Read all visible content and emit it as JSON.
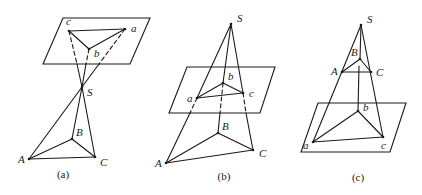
{
  "figure": {
    "panels": [
      {
        "id": "a",
        "caption": "(a)",
        "caption_pos": [
          63,
          178
        ],
        "plane": [
          [
            63,
            18
          ],
          [
            150,
            18
          ],
          [
            130,
            64
          ],
          [
            43,
            64
          ]
        ],
        "points": {
          "c": {
            "xy": [
              69,
              31
            ],
            "label": "c",
            "label_offset": [
              -3,
              -6
            ]
          },
          "a": {
            "xy": [
              125,
              29
            ],
            "label": "a",
            "label_offset": [
              6,
              3
            ]
          },
          "b": {
            "xy": [
              89,
              49
            ],
            "label": "b",
            "label_offset": [
              5,
              8
            ]
          },
          "S": {
            "xy": [
              82,
              87
            ],
            "label": "S",
            "label_offset": [
              5,
              9
            ]
          },
          "B": {
            "xy": [
              72,
              139
            ],
            "label": "B",
            "label_offset": [
              4,
              -3
            ]
          },
          "A": {
            "xy": [
              29,
              159
            ],
            "label": "A",
            "label_offset": [
              -11,
              4
            ]
          },
          "C": {
            "xy": [
              95,
              157
            ],
            "label": "C",
            "label_offset": [
              5,
              9
            ]
          }
        },
        "edges": [
          {
            "from": [
              69,
              31
            ],
            "to": [
              125,
              29
            ],
            "style": "solid"
          },
          {
            "from": [
              69,
              31
            ],
            "to": [
              89,
              49
            ],
            "style": "solid"
          },
          {
            "from": [
              89,
              49
            ],
            "to": [
              125,
              29
            ],
            "style": "solid"
          },
          {
            "from": [
              69,
              31
            ],
            "to": [
              77,
              64
            ],
            "style": "dashed"
          },
          {
            "from": [
              89,
              49
            ],
            "to": [
              86,
              64
            ],
            "style": "dashed"
          },
          {
            "from": [
              125,
              29
            ],
            "to": [
              99,
              64
            ],
            "style": "dashed"
          },
          {
            "from": [
              77,
              64
            ],
            "to": [
              82,
              87
            ],
            "style": "solid"
          },
          {
            "from": [
              86,
              64
            ],
            "to": [
              82,
              87
            ],
            "style": "solid"
          },
          {
            "from": [
              99,
              64
            ],
            "to": [
              82,
              87
            ],
            "style": "solid"
          },
          {
            "from": [
              82,
              87
            ],
            "to": [
              29,
              159
            ],
            "style": "solid"
          },
          {
            "from": [
              82,
              87
            ],
            "to": [
              72,
              139
            ],
            "style": "solid"
          },
          {
            "from": [
              82,
              87
            ],
            "to": [
              95,
              157
            ],
            "style": "solid"
          },
          {
            "from": [
              29,
              159
            ],
            "to": [
              72,
              139
            ],
            "style": "solid"
          },
          {
            "from": [
              72,
              139
            ],
            "to": [
              95,
              157
            ],
            "style": "solid"
          },
          {
            "from": [
              29,
              159
            ],
            "to": [
              95,
              157
            ],
            "style": "solid"
          }
        ]
      },
      {
        "id": "b",
        "caption": "(b)",
        "caption_pos": [
          224,
          180
        ],
        "plane": [
          [
            187,
            67
          ],
          [
            275,
            67
          ],
          [
            260,
            113
          ],
          [
            169,
            113
          ]
        ],
        "points": {
          "S": {
            "xy": [
              231,
              24
            ],
            "label": "S",
            "label_offset": [
              6,
              -2
            ]
          },
          "b": {
            "xy": [
              223,
              83
            ],
            "label": "b",
            "label_offset": [
              5,
              -3
            ]
          },
          "a": {
            "xy": [
              197,
              98
            ],
            "label": "a",
            "label_offset": [
              -10,
              4
            ]
          },
          "c": {
            "xy": [
              243,
              93
            ],
            "label": "c",
            "label_offset": [
              6,
              4
            ]
          },
          "B": {
            "xy": [
              218,
              133
            ],
            "label": "B",
            "label_offset": [
              4,
              -3
            ]
          },
          "A": {
            "xy": [
              166,
              163
            ],
            "label": "A",
            "label_offset": [
              -11,
              4
            ]
          },
          "C": {
            "xy": [
              253,
              150
            ],
            "label": "C",
            "label_offset": [
              6,
              7
            ]
          }
        },
        "edges": [
          {
            "from": [
              231,
              24
            ],
            "to": [
              197,
              98
            ],
            "style": "solid"
          },
          {
            "from": [
              231,
              24
            ],
            "to": [
              223,
              83
            ],
            "style": "solid"
          },
          {
            "from": [
              231,
              24
            ],
            "to": [
              243,
              93
            ],
            "style": "solid"
          },
          {
            "from": [
              197,
              98
            ],
            "to": [
              223,
              83
            ],
            "style": "solid"
          },
          {
            "from": [
              223,
              83
            ],
            "to": [
              243,
              93
            ],
            "style": "solid"
          },
          {
            "from": [
              197,
              98
            ],
            "to": [
              243,
              93
            ],
            "style": "solid"
          },
          {
            "from": [
              197,
              98
            ],
            "to": [
              190,
              113
            ],
            "style": "dashed"
          },
          {
            "from": [
              223,
              83
            ],
            "to": [
              220,
              113
            ],
            "style": "dashed"
          },
          {
            "from": [
              243,
              93
            ],
            "to": [
              246,
              113
            ],
            "style": "dashed"
          },
          {
            "from": [
              190,
              113
            ],
            "to": [
              166,
              163
            ],
            "style": "solid"
          },
          {
            "from": [
              220,
              113
            ],
            "to": [
              218,
              133
            ],
            "style": "solid"
          },
          {
            "from": [
              246,
              113
            ],
            "to": [
              253,
              150
            ],
            "style": "solid"
          },
          {
            "from": [
              166,
              163
            ],
            "to": [
              218,
              133
            ],
            "style": "solid"
          },
          {
            "from": [
              218,
              133
            ],
            "to": [
              253,
              150
            ],
            "style": "solid"
          },
          {
            "from": [
              166,
              163
            ],
            "to": [
              253,
              150
            ],
            "style": "solid"
          }
        ]
      },
      {
        "id": "c",
        "caption": "(c)",
        "caption_pos": [
          358,
          181
        ],
        "plane": [
          [
            318,
            103
          ],
          [
            406,
            103
          ],
          [
            390,
            152
          ],
          [
            301,
            152
          ]
        ],
        "points": {
          "S": {
            "xy": [
              361,
              25
            ],
            "label": "S",
            "label_offset": [
              6,
              -2
            ]
          },
          "B": {
            "xy": [
              360,
              59
            ],
            "label": "B",
            "label_offset": [
              -9,
              -3
            ]
          },
          "A": {
            "xy": [
              342,
              72
            ],
            "label": "A",
            "label_offset": [
              -11,
              3
            ]
          },
          "C": {
            "xy": [
              371,
              72
            ],
            "label": "C",
            "label_offset": [
              5,
              4
            ]
          },
          "b": {
            "xy": [
              358,
              111
            ],
            "label": "b",
            "label_offset": [
              5,
              0
            ]
          },
          "a": {
            "xy": [
              313,
              142
            ],
            "label": "a",
            "label_offset": [
              -10,
              7
            ]
          },
          "c": {
            "xy": [
              383,
              137
            ],
            "label": "c",
            "label_offset": [
              -2,
              12
            ]
          }
        },
        "edges": [
          {
            "from": [
              361,
              25
            ],
            "to": [
              313,
              142
            ],
            "style": "solid"
          },
          {
            "from": [
              361,
              25
            ],
            "to": [
              383,
              137
            ],
            "style": "solid"
          },
          {
            "from": [
              361,
              25
            ],
            "to": [
              360,
              59
            ],
            "style": "solid"
          },
          {
            "from": [
              342,
              72
            ],
            "to": [
              360,
              59
            ],
            "style": "solid"
          },
          {
            "from": [
              360,
              59
            ],
            "to": [
              371,
              72
            ],
            "style": "solid"
          },
          {
            "from": [
              342,
              72
            ],
            "to": [
              371,
              72
            ],
            "style": "solid"
          },
          {
            "from": [
              359,
              66
            ],
            "to": [
              358,
              111
            ],
            "style": "solid"
          },
          {
            "from": [
              313,
              142
            ],
            "to": [
              358,
              111
            ],
            "style": "solid"
          },
          {
            "from": [
              358,
              111
            ],
            "to": [
              383,
              137
            ],
            "style": "solid"
          },
          {
            "from": [
              313,
              142
            ],
            "to": [
              383,
              137
            ],
            "style": "solid"
          }
        ]
      }
    ]
  }
}
